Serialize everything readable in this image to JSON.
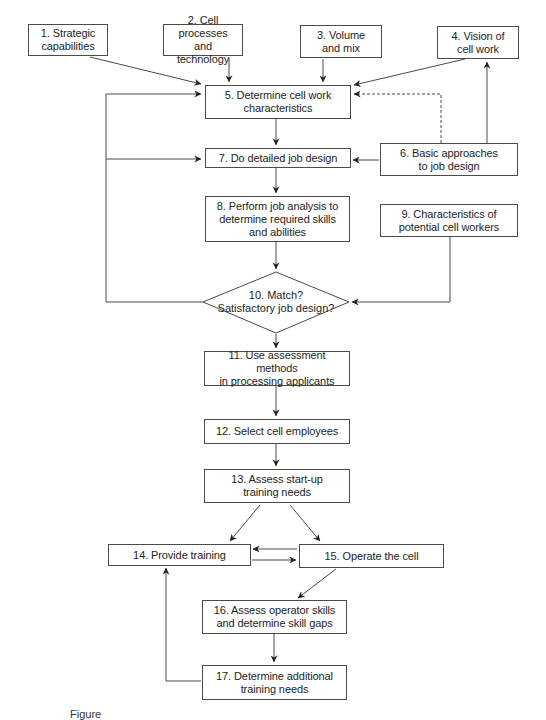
{
  "diagram": {
    "type": "flowchart",
    "colors": {
      "line": "#4a4a4a",
      "text": "#1e1e1e",
      "background": "#ffffff"
    },
    "nodes": [
      {
        "id": 1,
        "shape": "box",
        "label": "1. Strategic\ncapabilities"
      },
      {
        "id": 2,
        "shape": "box",
        "label": "2. Cell processes\nand technology"
      },
      {
        "id": 3,
        "shape": "box",
        "label": "3. Volume\nand mix"
      },
      {
        "id": 4,
        "shape": "box",
        "label": "4. Vision of\ncell work"
      },
      {
        "id": 5,
        "shape": "box",
        "label": "5. Determine cell work\ncharacteristics"
      },
      {
        "id": 6,
        "shape": "box",
        "label": "6. Basic approaches\nto job design"
      },
      {
        "id": 7,
        "shape": "box",
        "label": "7. Do detailed job design"
      },
      {
        "id": 8,
        "shape": "box",
        "label": "8. Perform job analysis to\ndetermine required skills\nand abilities"
      },
      {
        "id": 9,
        "shape": "box",
        "label": "9. Characteristics of\npotential cell workers"
      },
      {
        "id": 10,
        "shape": "diamond",
        "label": "10. Match?\nSatisfactory job design?"
      },
      {
        "id": 11,
        "shape": "box",
        "label": "11. Use assessment methods\nin processing applicants"
      },
      {
        "id": 12,
        "shape": "box",
        "label": "12. Select cell employees"
      },
      {
        "id": 13,
        "shape": "box",
        "label": "13. Assess start-up\ntraining needs"
      },
      {
        "id": 14,
        "shape": "box",
        "label": "14. Provide training"
      },
      {
        "id": 15,
        "shape": "box",
        "label": "15. Operate the cell"
      },
      {
        "id": 16,
        "shape": "box",
        "label": "16. Assess operator skills\nand determine skill gaps"
      },
      {
        "id": 17,
        "shape": "box",
        "label": "17. Determine additional\ntraining needs"
      }
    ],
    "edges": [
      {
        "from": 1,
        "to": 5,
        "style": "solid"
      },
      {
        "from": 2,
        "to": 5,
        "style": "solid"
      },
      {
        "from": 3,
        "to": 5,
        "style": "solid"
      },
      {
        "from": 4,
        "to": 5,
        "style": "solid"
      },
      {
        "from": 6,
        "to": 5,
        "style": "dashed"
      },
      {
        "from": 6,
        "to": 4,
        "style": "solid"
      },
      {
        "from": 5,
        "to": 7,
        "style": "solid"
      },
      {
        "from": 6,
        "to": 7,
        "style": "solid"
      },
      {
        "from": 7,
        "to": 8,
        "style": "solid"
      },
      {
        "from": 8,
        "to": 10,
        "style": "solid"
      },
      {
        "from": 9,
        "to": 10,
        "style": "solid"
      },
      {
        "from": 10,
        "to": 5,
        "style": "solid",
        "note": "loop back (no match)"
      },
      {
        "from": 10,
        "to": 7,
        "style": "solid",
        "note": "loop back (no match)"
      },
      {
        "from": 10,
        "to": 11,
        "style": "solid"
      },
      {
        "from": 11,
        "to": 12,
        "style": "solid"
      },
      {
        "from": 12,
        "to": 13,
        "style": "solid"
      },
      {
        "from": 13,
        "to": 14,
        "style": "solid"
      },
      {
        "from": 13,
        "to": 15,
        "style": "solid"
      },
      {
        "from": 14,
        "to": 15,
        "style": "solid"
      },
      {
        "from": 15,
        "to": 14,
        "style": "solid"
      },
      {
        "from": 15,
        "to": 16,
        "style": "solid"
      },
      {
        "from": 16,
        "to": 17,
        "style": "solid"
      },
      {
        "from": 17,
        "to": 14,
        "style": "solid"
      }
    ],
    "caption": "Figure"
  }
}
